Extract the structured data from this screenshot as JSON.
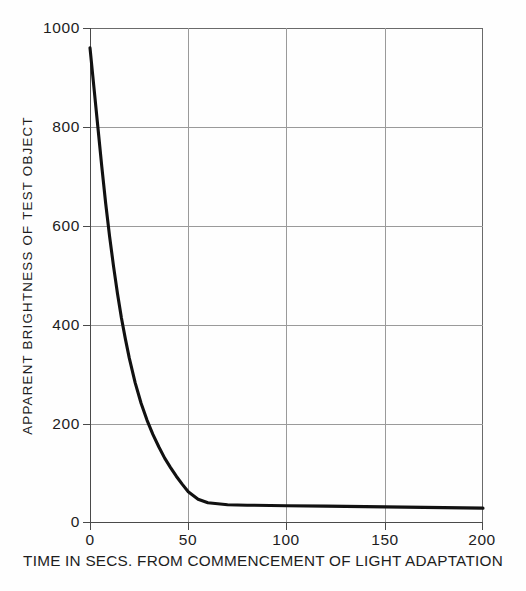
{
  "figure": {
    "background_color": "#fefefe",
    "ink_color": "#1a1a1a",
    "grid_color": "#9a9a9a",
    "curve_color": "#111111"
  },
  "chart_data": {
    "type": "line",
    "title": "",
    "xlabel": "TIME IN SECS. FROM COMMENCEMENT OF LIGHT ADAPTATION",
    "ylabel": "APPARENT BRIGHTNESS OF TEST OBJECT",
    "xlim": [
      0,
      200
    ],
    "ylim": [
      0,
      1000
    ],
    "xticks": [
      0,
      50,
      100,
      150,
      200
    ],
    "yticks": [
      0,
      200,
      400,
      600,
      800,
      1000
    ],
    "xtick_labels": [
      "0",
      "50",
      "100",
      "150",
      "200"
    ],
    "ytick_labels": [
      "0",
      "200",
      "400",
      "600",
      "800",
      "1000"
    ],
    "grid": true,
    "grid_style": "solid thin",
    "legend": "none",
    "series": [
      {
        "name": "apparent brightness decay",
        "x": [
          0,
          2,
          4,
          6,
          8,
          10,
          12,
          14,
          16,
          18,
          20,
          23,
          26,
          29,
          32,
          35,
          38,
          41,
          44,
          47,
          50,
          55,
          60,
          70,
          80,
          100,
          120,
          140,
          160,
          180,
          200
        ],
        "y": [
          960,
          880,
          800,
          720,
          645,
          578,
          518,
          463,
          414,
          372,
          333,
          283,
          242,
          208,
          179,
          154,
          131,
          112,
          94,
          78,
          63,
          48,
          41,
          37,
          36,
          35,
          34,
          33,
          32,
          31,
          30
        ]
      }
    ],
    "annotations": []
  }
}
